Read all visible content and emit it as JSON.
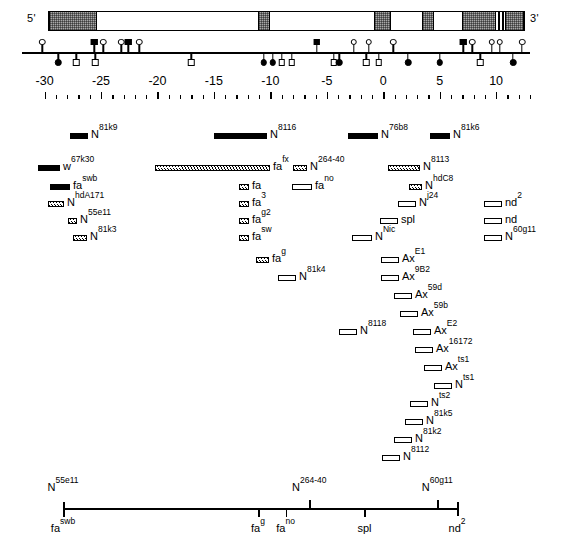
{
  "figure": {
    "prime5": "5'",
    "prime3": "3'"
  },
  "gene_structure": {
    "name": "notch-transcription-unit",
    "exons": [
      {
        "left_pct": 0.0,
        "width_pct": 10.0
      },
      {
        "left_pct": 44.0,
        "width_pct": 2.6
      },
      {
        "left_pct": 68.5,
        "width_pct": 3.4
      },
      {
        "left_pct": 78.5,
        "width_pct": 2.6
      },
      {
        "left_pct": 87.0,
        "width_pct": 7.0
      },
      {
        "left_pct": 96.0,
        "width_pct": 4.0
      }
    ],
    "big_exon": {
      "left_pct": 87.0,
      "width_pct": 7.0
    },
    "thin_bars": [
      {
        "left_pct": 94.6
      },
      {
        "left_pct": 95.4
      }
    ]
  },
  "axis": {
    "name": "coordinate-axis",
    "unit_label": "",
    "tick_labels": [
      "-30",
      "-25",
      "-20",
      "-15",
      "-10",
      "-5",
      "0",
      "5",
      "10"
    ],
    "tick_values": [
      -30,
      -25,
      -20,
      -15,
      -10,
      -5,
      0,
      5,
      10
    ],
    "min": -32,
    "max": 13,
    "minor_step": 1
  },
  "markers": {
    "name": "breakpoint-markers",
    "above": [
      {
        "x": -30.2,
        "shape": "circle-open"
      },
      {
        "x": -25.6,
        "shape": "square-fill"
      },
      {
        "x": -24.8,
        "shape": "circle-open"
      },
      {
        "x": -23.2,
        "shape": "circle-open"
      },
      {
        "x": -22.6,
        "shape": "square-fill"
      },
      {
        "x": -21.6,
        "shape": "circle-open"
      },
      {
        "x": -5.9,
        "shape": "square-fill"
      },
      {
        "x": -2.6,
        "shape": "circle-open"
      },
      {
        "x": -1.3,
        "shape": "circle-open"
      },
      {
        "x": 0.9,
        "shape": "circle-open"
      },
      {
        "x": 7.1,
        "shape": "square-fill"
      },
      {
        "x": 7.9,
        "shape": "circle-open"
      },
      {
        "x": 9.6,
        "shape": "circle-open"
      },
      {
        "x": 10.3,
        "shape": "circle-open"
      },
      {
        "x": 12.3,
        "shape": "circle-open"
      }
    ],
    "below": [
      {
        "x": -28.8,
        "shape": "circle-fill"
      },
      {
        "x": -27.2,
        "shape": "square-open"
      },
      {
        "x": -25.5,
        "shape": "square-open"
      },
      {
        "x": -17.0,
        "shape": "square-open"
      },
      {
        "x": -10.6,
        "shape": "circle-fill"
      },
      {
        "x": -9.8,
        "shape": "circle-fill"
      },
      {
        "x": -9.0,
        "shape": "square-open"
      },
      {
        "x": -8.1,
        "shape": "square-open"
      },
      {
        "x": -4.4,
        "shape": "square-open"
      },
      {
        "x": -3.9,
        "shape": "circle-fill"
      },
      {
        "x": -1.5,
        "shape": "square-open"
      },
      {
        "x": -0.4,
        "shape": "square-open"
      },
      {
        "x": 2.2,
        "shape": "circle-fill"
      },
      {
        "x": 5.0,
        "shape": "circle-fill"
      },
      {
        "x": 8.6,
        "shape": "square-open"
      },
      {
        "x": 11.5,
        "shape": "circle-fill"
      }
    ]
  },
  "alleles": [
    {
      "gene": "N",
      "sup": "81k9",
      "bar": "solid",
      "bar_w": 18,
      "left": 70,
      "top": 128
    },
    {
      "gene": "N",
      "sup": "8116",
      "bar": "solid",
      "bar_w": 53,
      "left": 214,
      "top": 128
    },
    {
      "gene": "N",
      "sup": "76b8",
      "bar": "solid",
      "bar_w": 30,
      "left": 348,
      "top": 128
    },
    {
      "gene": "N",
      "sup": "81k6",
      "bar": "solid",
      "bar_w": 20,
      "left": 430,
      "top": 128
    },
    {
      "gene": "w",
      "sup": "67k30",
      "bar": "solid",
      "bar_w": 22,
      "left": 38,
      "top": 160
    },
    {
      "gene": "fa",
      "sup": "fx",
      "bar": "hatch",
      "bar_w": 115,
      "left": 155,
      "top": 160
    },
    {
      "gene": "N",
      "sup": "264-40",
      "bar": "hatch",
      "bar_w": 14,
      "left": 293,
      "top": 160
    },
    {
      "gene": "N",
      "sup": "8113",
      "bar": "hatch",
      "bar_w": 32,
      "left": 388,
      "top": 160
    },
    {
      "gene": "fa",
      "sup": "swb",
      "bar": "solid",
      "bar_w": 20,
      "left": 50,
      "top": 179
    },
    {
      "gene": "fa",
      "sup": "",
      "bar": "hatch",
      "bar_w": 10,
      "left": 239,
      "top": 179
    },
    {
      "gene": "fa",
      "sup": "no",
      "bar": "open",
      "bar_w": 20,
      "left": 292,
      "top": 179
    },
    {
      "gene": "N",
      "sup": "hdC8",
      "bar": "hatch",
      "bar_w": 13,
      "left": 409,
      "top": 179
    },
    {
      "gene": "N",
      "sup": "hdA171",
      "bar": "hatch",
      "bar_w": 16,
      "left": 48,
      "top": 196
    },
    {
      "gene": "fa",
      "sup": "3",
      "bar": "hatch",
      "bar_w": 10,
      "left": 239,
      "top": 196
    },
    {
      "gene": "N",
      "sup": "j24",
      "bar": "open",
      "bar_w": 18,
      "left": 398,
      "top": 196
    },
    {
      "gene": "nd",
      "sup": "2",
      "bar": "open",
      "bar_w": 18,
      "left": 484,
      "top": 196
    },
    {
      "gene": "N",
      "sup": "55e11",
      "bar": "hatch",
      "bar_w": 9,
      "left": 68,
      "top": 213
    },
    {
      "gene": "fa",
      "sup": "g2",
      "bar": "hatch",
      "bar_w": 10,
      "left": 239,
      "top": 213
    },
    {
      "gene": "spl",
      "sup": "",
      "bar": "open",
      "bar_w": 18,
      "left": 380,
      "top": 213
    },
    {
      "gene": "nd",
      "sup": "",
      "bar": "open",
      "bar_w": 18,
      "left": 484,
      "top": 213
    },
    {
      "gene": "N",
      "sup": "81k3",
      "bar": "hatch",
      "bar_w": 14,
      "left": 73,
      "top": 230
    },
    {
      "gene": "fa",
      "sup": "sw",
      "bar": "hatch",
      "bar_w": 10,
      "left": 239,
      "top": 230
    },
    {
      "gene": "N",
      "sup": "Nic",
      "bar": "open",
      "bar_w": 20,
      "left": 352,
      "top": 230
    },
    {
      "gene": "N",
      "sup": "60g11",
      "bar": "open",
      "bar_w": 18,
      "left": 484,
      "top": 230
    },
    {
      "gene": "fa",
      "sup": "g",
      "bar": "hatch",
      "bar_w": 13,
      "left": 256,
      "top": 252
    },
    {
      "gene": "Ax",
      "sup": "E1",
      "bar": "open",
      "bar_w": 18,
      "left": 381,
      "top": 252
    },
    {
      "gene": "N",
      "sup": "81k4",
      "bar": "open",
      "bar_w": 18,
      "left": 278,
      "top": 270
    },
    {
      "gene": "Ax",
      "sup": "9B2",
      "bar": "open",
      "bar_w": 18,
      "left": 381,
      "top": 270
    },
    {
      "gene": "Ax",
      "sup": "59d",
      "bar": "open",
      "bar_w": 18,
      "left": 394,
      "top": 288
    },
    {
      "gene": "Ax",
      "sup": "59b",
      "bar": "open",
      "bar_w": 18,
      "left": 400,
      "top": 306
    },
    {
      "gene": "N",
      "sup": "8118",
      "bar": "open",
      "bar_w": 18,
      "left": 339,
      "top": 324
    },
    {
      "gene": "Ax",
      "sup": "E2",
      "bar": "open",
      "bar_w": 18,
      "left": 413,
      "top": 324
    },
    {
      "gene": "Ax",
      "sup": "16172",
      "bar": "open",
      "bar_w": 18,
      "left": 415,
      "top": 342
    },
    {
      "gene": "Ax",
      "sup": "ts1",
      "bar": "open",
      "bar_w": 18,
      "left": 424,
      "top": 360
    },
    {
      "gene": "N",
      "sup": "ts1",
      "bar": "open",
      "bar_w": 18,
      "left": 434,
      "top": 378
    },
    {
      "gene": "N",
      "sup": "ts2",
      "bar": "open",
      "bar_w": 18,
      "left": 410,
      "top": 396
    },
    {
      "gene": "N",
      "sup": "81k5",
      "bar": "open",
      "bar_w": 18,
      "left": 405,
      "top": 414
    },
    {
      "gene": "N",
      "sup": "81k2",
      "bar": "open",
      "bar_w": 18,
      "left": 394,
      "top": 432
    },
    {
      "gene": "N",
      "sup": "8112",
      "bar": "open",
      "bar_w": 18,
      "left": 382,
      "top": 450
    }
  ],
  "bottom_map": {
    "name": "genetic-summary-map",
    "above_markers": [
      {
        "label_gene": "N",
        "label_sup": "55e11",
        "x_pct": 0.0,
        "tick": "full"
      },
      {
        "label_gene": "N",
        "label_sup": "264-40",
        "x_pct": 62.5,
        "tick": "up"
      },
      {
        "label_gene": "N",
        "label_sup": "60g11",
        "x_pct": 95.0,
        "tick": "up"
      }
    ],
    "below_markers": [
      {
        "label_gene": "fa",
        "label_sup": "swb",
        "x_pct": 0.0,
        "tick": "down"
      },
      {
        "label_gene": "fa",
        "label_sup": "g",
        "x_pct": 49.5,
        "tick": "down"
      },
      {
        "label_gene": "fa",
        "label_sup": "no",
        "x_pct": 56.5,
        "tick": "down"
      },
      {
        "label_gene": "spl",
        "label_sup": "",
        "x_pct": 76.5,
        "tick": "down"
      },
      {
        "label_gene": "nd",
        "label_sup": "2",
        "x_pct": 100.0,
        "tick": "full"
      }
    ]
  }
}
